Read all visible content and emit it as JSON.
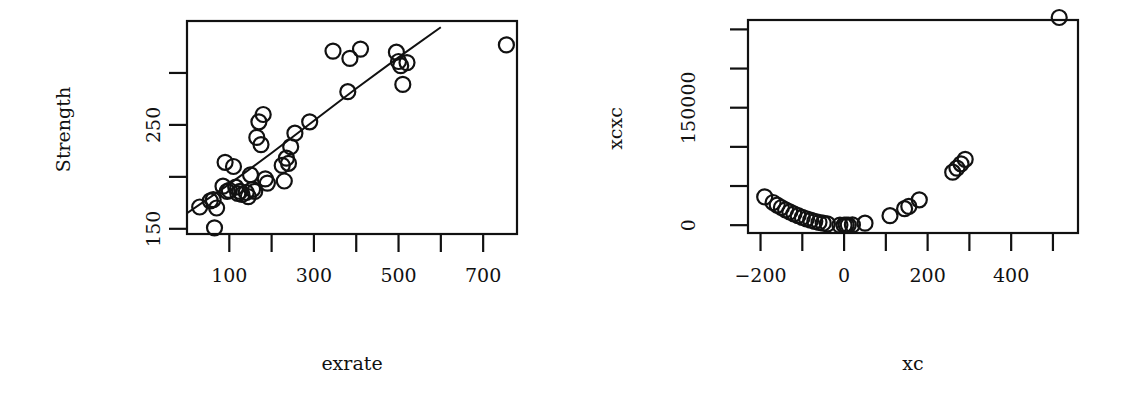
{
  "chart_data": [
    {
      "type": "scatter",
      "title": "",
      "xlabel": "exrate",
      "ylabel": "Strength",
      "xlim": [
        0,
        780
      ],
      "ylim": [
        145,
        350
      ],
      "xticks": [
        100,
        200,
        300,
        400,
        500,
        600,
        700
      ],
      "xtick_labels": [
        "100",
        "",
        "300",
        "",
        "500",
        "",
        "700"
      ],
      "yticks": [
        150,
        200,
        250,
        300
      ],
      "ytick_labels": [
        "150",
        "",
        "250",
        ""
      ],
      "grid": false,
      "legend": null,
      "marker": "open-circle",
      "fit_line": {
        "type": "curve",
        "points": [
          [
            0,
            165
          ],
          [
            100,
            193
          ],
          [
            200,
            223
          ],
          [
            300,
            254
          ],
          [
            400,
            285
          ],
          [
            500,
            315
          ],
          [
            600,
            344
          ]
        ]
      },
      "points": [
        [
          30,
          171
        ],
        [
          55,
          177
        ],
        [
          62,
          178
        ],
        [
          70,
          170
        ],
        [
          65,
          151
        ],
        [
          85,
          191
        ],
        [
          95,
          186
        ],
        [
          100,
          187
        ],
        [
          90,
          214
        ],
        [
          110,
          210
        ],
        [
          115,
          190
        ],
        [
          120,
          184
        ],
        [
          125,
          186
        ],
        [
          130,
          183
        ],
        [
          140,
          185
        ],
        [
          145,
          181
        ],
        [
          150,
          202
        ],
        [
          155,
          188
        ],
        [
          160,
          186
        ],
        [
          165,
          238
        ],
        [
          170,
          253
        ],
        [
          175,
          231
        ],
        [
          180,
          260
        ],
        [
          185,
          198
        ],
        [
          190,
          194
        ],
        [
          225,
          211
        ],
        [
          230,
          196
        ],
        [
          235,
          218
        ],
        [
          240,
          213
        ],
        [
          245,
          229
        ],
        [
          255,
          242
        ],
        [
          290,
          253
        ],
        [
          345,
          321
        ],
        [
          385,
          314
        ],
        [
          410,
          323
        ],
        [
          380,
          282
        ],
        [
          495,
          320
        ],
        [
          500,
          311
        ],
        [
          505,
          307
        ],
        [
          510,
          289
        ],
        [
          520,
          310
        ],
        [
          755,
          327
        ]
      ]
    },
    {
      "type": "scatter",
      "title": "",
      "xlabel": "xc",
      "ylabel": "xcxc",
      "xlim": [
        -230,
        560
      ],
      "ylim": [
        -10000,
        262000
      ],
      "xticks": [
        -200,
        -100,
        0,
        100,
        200,
        300,
        400,
        500
      ],
      "xtick_labels": [
        "−200",
        "",
        "0",
        "",
        "200",
        "",
        "400",
        ""
      ],
      "yticks": [
        0,
        50000,
        100000,
        150000,
        200000,
        250000
      ],
      "ytick_labels": [
        "0",
        "",
        "",
        "150000",
        "",
        ""
      ],
      "grid": false,
      "legend": null,
      "marker": "open-circle",
      "points": [
        [
          -190,
          36100
        ],
        [
          -170,
          28900
        ],
        [
          -160,
          25600
        ],
        [
          -150,
          22500
        ],
        [
          -140,
          19600
        ],
        [
          -130,
          16900
        ],
        [
          -120,
          14400
        ],
        [
          -110,
          12100
        ],
        [
          -100,
          10000
        ],
        [
          -90,
          8100
        ],
        [
          -80,
          6400
        ],
        [
          -70,
          4900
        ],
        [
          -60,
          3600
        ],
        [
          -50,
          2500
        ],
        [
          -40,
          1600
        ],
        [
          -10,
          100
        ],
        [
          0,
          0
        ],
        [
          5,
          25
        ],
        [
          10,
          100
        ],
        [
          20,
          400
        ],
        [
          50,
          2500
        ],
        [
          110,
          12100
        ],
        [
          145,
          21000
        ],
        [
          155,
          24000
        ],
        [
          180,
          32400
        ],
        [
          260,
          67600
        ],
        [
          270,
          72900
        ],
        [
          280,
          78400
        ],
        [
          290,
          84100
        ],
        [
          515,
          265225
        ]
      ]
    }
  ]
}
